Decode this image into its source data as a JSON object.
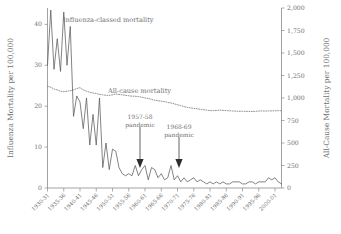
{
  "chart_data": {
    "type": "line",
    "title": "",
    "subtitle": "",
    "xlabel": "",
    "ylabel": "Influenza Mortality per 100,000",
    "y2label": "All-Cause Mortality per 100,000",
    "grid": false,
    "legend_position": "inline-annotations",
    "ylim": [
      0,
      44
    ],
    "y2lim": [
      0,
      2000
    ],
    "yticks": [
      0,
      10,
      20,
      30,
      40
    ],
    "ytick_labels": [
      "0",
      "10",
      "20",
      "30",
      "40"
    ],
    "y2ticks": [
      0,
      250,
      500,
      750,
      1000,
      1250,
      1500,
      1750,
      2000
    ],
    "y2tick_labels": [
      "0",
      "250",
      "500",
      "750",
      "1,000",
      "1,250",
      "1,500",
      "1,750",
      "2,000"
    ],
    "xtick_labels": [
      "1930-31",
      "1935-36",
      "1940-41",
      "1945-46",
      "1950-51",
      "1955-56",
      "1960-61",
      "1965-66",
      "1970-71",
      "1975-76",
      "1980-81",
      "1985-86",
      "1990-91",
      "1995-96",
      "2000-01"
    ],
    "xlim": [
      "1930-31",
      "2002-03"
    ],
    "x": [
      "1930-31",
      "1931-32",
      "1932-33",
      "1933-34",
      "1934-35",
      "1935-36",
      "1936-37",
      "1937-38",
      "1938-39",
      "1939-40",
      "1940-41",
      "1941-42",
      "1942-43",
      "1943-44",
      "1944-45",
      "1945-46",
      "1946-47",
      "1947-48",
      "1948-49",
      "1949-50",
      "1950-51",
      "1951-52",
      "1952-53",
      "1953-54",
      "1954-55",
      "1955-56",
      "1956-57",
      "1957-58",
      "1958-59",
      "1959-60",
      "1960-61",
      "1961-62",
      "1962-63",
      "1963-64",
      "1964-65",
      "1965-66",
      "1966-67",
      "1967-68",
      "1968-69",
      "1969-70",
      "1970-71",
      "1971-72",
      "1972-73",
      "1973-74",
      "1974-75",
      "1975-76",
      "1976-77",
      "1977-78",
      "1978-79",
      "1979-80",
      "1980-81",
      "1981-82",
      "1982-83",
      "1983-84",
      "1984-85",
      "1985-86",
      "1986-87",
      "1987-88",
      "1988-89",
      "1989-90",
      "1990-91",
      "1991-92",
      "1992-93",
      "1993-94",
      "1994-95",
      "1995-96",
      "1996-97",
      "1997-98",
      "1998-99",
      "1999-00",
      "2000-01",
      "2001-02",
      "2002-03"
    ],
    "series": [
      {
        "name": "Influenza-classed mortality",
        "axis": "left",
        "style": "solid",
        "values": [
          30.0,
          43.5,
          29.0,
          36.5,
          28.5,
          43.0,
          30.0,
          39.5,
          17.5,
          22.5,
          21.0,
          14.5,
          22.0,
          10.5,
          18.0,
          10.5,
          22.0,
          5.0,
          11.0,
          4.5,
          9.5,
          9.0,
          5.0,
          3.5,
          3.0,
          3.5,
          3.0,
          5.5,
          3.0,
          4.5,
          5.5,
          2.0,
          5.0,
          4.5,
          2.5,
          3.5,
          2.0,
          2.5,
          5.5,
          2.0,
          3.0,
          1.5,
          2.5,
          1.5,
          2.0,
          2.5,
          1.5,
          2.0,
          1.5,
          1.0,
          1.5,
          1.0,
          1.5,
          1.0,
          1.5,
          1.0,
          1.0,
          1.5,
          1.5,
          1.5,
          1.0,
          1.0,
          1.5,
          1.5,
          1.0,
          1.5,
          1.5,
          1.5,
          2.5,
          2.0,
          2.5,
          1.5,
          1.0
        ]
      },
      {
        "name": "All-cause mortality",
        "axis": "right",
        "style": "dotted",
        "values": [
          1130,
          1120,
          1100,
          1090,
          1075,
          1070,
          1075,
          1080,
          1090,
          1105,
          1115,
          1090,
          1075,
          1065,
          1055,
          1050,
          1040,
          1035,
          1030,
          1030,
          1035,
          1045,
          1040,
          1035,
          1030,
          1025,
          1020,
          1020,
          1015,
          1010,
          1000,
          995,
          985,
          975,
          970,
          965,
          960,
          950,
          945,
          935,
          925,
          915,
          905,
          895,
          890,
          885,
          880,
          875,
          870,
          865,
          860,
          860,
          862,
          865,
          863,
          860,
          858,
          856,
          854,
          852,
          853,
          852,
          851,
          850,
          852,
          855,
          856,
          855,
          856,
          857,
          858,
          860,
          858
        ]
      }
    ],
    "annotations": [
      {
        "name": "flu-series-label",
        "text": "Influenza-classed mortality",
        "x_px": 63,
        "y_px": 22
      },
      {
        "name": "all-series-label",
        "text": "All-cause mortality",
        "x_px": 108,
        "y_px": 93
      },
      {
        "name": "pandemic-1957",
        "line1": "1957-58",
        "line2": "pandemic",
        "x_px": 119,
        "y_px": 119,
        "arrow_target_x": 140,
        "arrow_target_y": 167
      },
      {
        "name": "pandemic-1968",
        "line1": "1968-69",
        "line2": "pandemic",
        "x_px": 156,
        "y_px": 129,
        "arrow_target_x": 179,
        "arrow_target_y": 167
      }
    ],
    "colors": {
      "flu_line": "#5a5a5a",
      "all_line": "#7b7b7b",
      "axis": "#8a8a8a",
      "text": "#6f6f6f",
      "arrow": "#2e2e2e",
      "background": "#ffffff"
    }
  }
}
